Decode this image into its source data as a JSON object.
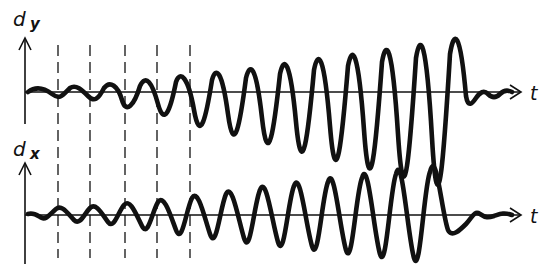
{
  "diagram": {
    "type": "signal-waveforms",
    "colors": {
      "ink": "#111111",
      "background": "#ffffff"
    },
    "panels": [
      {
        "id": "dy",
        "axis_label_main": "d",
        "axis_label_sub": "y",
        "time_label": "t",
        "axis_y": 92,
        "waveform": "growing oscillation that starts in phase with the reference, then ends with a short damped tail"
      },
      {
        "id": "dx",
        "axis_label_main": "d",
        "axis_label_sub": "x",
        "time_label": "t",
        "axis_y": 215,
        "waveform": "growing oscillation, phase-shifted relative to dy, ending with a short damped tail"
      }
    ],
    "dashed_markers": {
      "count": 5,
      "x_positions": [
        58,
        90,
        125,
        157,
        190
      ]
    }
  }
}
